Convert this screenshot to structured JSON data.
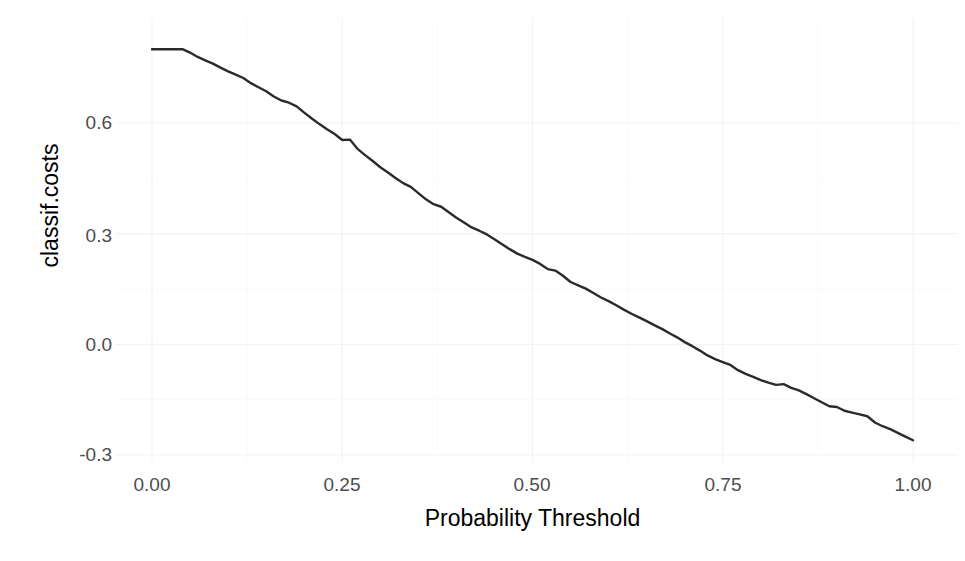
{
  "figure": {
    "clipped_header_text": "",
    "background_color": "#ffffff",
    "line_color": "#2b2b2b",
    "grid_color": "#f3f3f3",
    "tick_label_color": "#4d4d4d",
    "axis_title_color": "#000000"
  },
  "axes": {
    "x_ticks": [
      "0.00",
      "0.25",
      "0.50",
      "0.75",
      "1.00"
    ],
    "y_ticks": [
      "0.6",
      "0.3",
      "0.0",
      "-0.3"
    ],
    "x_title": "Probability Threshold",
    "y_title": "classif.costs"
  },
  "chart_data": {
    "type": "line",
    "title": "",
    "subtitle": "",
    "xlabel": "Probability Threshold",
    "ylabel": "classif.costs",
    "xlim": [
      0.0,
      1.0
    ],
    "ylim": [
      -0.32,
      0.82
    ],
    "xticks": [
      0.0,
      0.25,
      0.5,
      0.75,
      1.0
    ],
    "xticklabels": [
      "0.00",
      "0.25",
      "0.50",
      "0.75",
      "1.00"
    ],
    "yticks": [
      0.6,
      0.3,
      0.0,
      -0.3
    ],
    "yticklabels": [
      "0.6",
      "0.3",
      "0.0",
      "-0.3"
    ],
    "grid": true,
    "grid_major_only": false,
    "legend": null,
    "legend_position": "none",
    "series": [
      {
        "name": "classif.costs",
        "color": "#2b2b2b",
        "line_width": 2.4,
        "x": [
          0.0,
          0.01,
          0.02,
          0.03,
          0.04,
          0.05,
          0.06,
          0.07,
          0.08,
          0.09,
          0.1,
          0.11,
          0.12,
          0.13,
          0.14,
          0.15,
          0.16,
          0.17,
          0.18,
          0.19,
          0.2,
          0.21,
          0.22,
          0.23,
          0.24,
          0.25,
          0.26,
          0.27,
          0.28,
          0.29,
          0.3,
          0.31,
          0.32,
          0.33,
          0.34,
          0.35,
          0.36,
          0.37,
          0.38,
          0.39,
          0.4,
          0.41,
          0.42,
          0.43,
          0.44,
          0.45,
          0.46,
          0.47,
          0.48,
          0.49,
          0.5,
          0.51,
          0.52,
          0.53,
          0.54,
          0.55,
          0.56,
          0.57,
          0.58,
          0.59,
          0.6,
          0.61,
          0.62,
          0.63,
          0.64,
          0.65,
          0.66,
          0.67,
          0.68,
          0.69,
          0.7,
          0.71,
          0.72,
          0.73,
          0.74,
          0.75,
          0.76,
          0.77,
          0.78,
          0.79,
          0.8,
          0.81,
          0.82,
          0.83,
          0.84,
          0.85,
          0.86,
          0.87,
          0.88,
          0.89,
          0.9,
          0.91,
          0.92,
          0.93,
          0.94,
          0.95,
          0.96,
          0.97,
          0.98,
          0.99,
          1.0
        ],
        "y": [
          0.8,
          0.8,
          0.8,
          0.8,
          0.8,
          0.791,
          0.779,
          0.77,
          0.761,
          0.75,
          0.74,
          0.731,
          0.722,
          0.708,
          0.697,
          0.686,
          0.672,
          0.661,
          0.655,
          0.645,
          0.628,
          0.612,
          0.597,
          0.583,
          0.57,
          0.554,
          0.555,
          0.53,
          0.513,
          0.497,
          0.48,
          0.466,
          0.451,
          0.437,
          0.427,
          0.41,
          0.393,
          0.38,
          0.373,
          0.358,
          0.343,
          0.33,
          0.317,
          0.308,
          0.298,
          0.285,
          0.271,
          0.258,
          0.246,
          0.237,
          0.229,
          0.218,
          0.204,
          0.2,
          0.186,
          0.169,
          0.16,
          0.151,
          0.139,
          0.127,
          0.117,
          0.106,
          0.094,
          0.083,
          0.073,
          0.063,
          0.052,
          0.042,
          0.03,
          0.019,
          0.006,
          -0.005,
          -0.017,
          -0.03,
          -0.04,
          -0.048,
          -0.056,
          -0.07,
          -0.08,
          -0.088,
          -0.097,
          -0.104,
          -0.11,
          -0.108,
          -0.118,
          -0.125,
          -0.135,
          -0.146,
          -0.157,
          -0.168,
          -0.17,
          -0.18,
          -0.185,
          -0.19,
          -0.195,
          -0.212,
          -0.222,
          -0.23,
          -0.24,
          -0.25,
          -0.26
        ]
      }
    ],
    "notes": {
      "shape": "monotone decreasing from ~0.80 at threshold 0 to a minimum of about -0.28 near threshold 0.82, then rising back to about -0.04 at threshold 1.00",
      "minimum_value": -0.28,
      "minimum_at_x": 0.82,
      "start_value": 0.8,
      "end_value": -0.04
    }
  }
}
